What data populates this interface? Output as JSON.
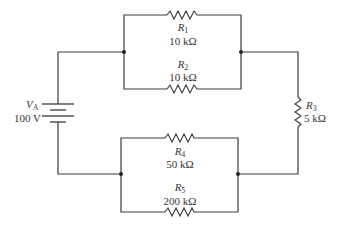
{
  "diagram": {
    "type": "circuit-schematic",
    "source": {
      "name": "V",
      "subscript": "A",
      "value": "100 V"
    },
    "resistors": [
      {
        "id": "R1",
        "name": "R",
        "subscript": "1",
        "value": "10 kΩ"
      },
      {
        "id": "R2",
        "name": "R",
        "subscript": "2",
        "value": "10 kΩ"
      },
      {
        "id": "R3",
        "name": "R",
        "subscript": "3",
        "value": "5 kΩ"
      },
      {
        "id": "R4",
        "name": "R",
        "subscript": "4",
        "value": "50 kΩ"
      },
      {
        "id": "R5",
        "name": "R",
        "subscript": "5",
        "value": "200 kΩ"
      }
    ],
    "topology": [
      "R1 parallel R2",
      "R4 parallel R5",
      "VA, (R1||R2), R3, (R4||R5) in series loop"
    ]
  }
}
